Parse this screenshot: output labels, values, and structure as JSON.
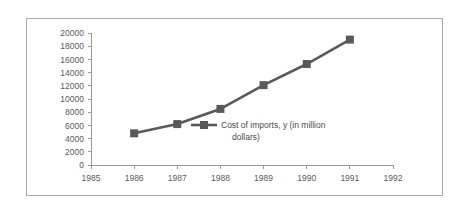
{
  "chart_data": {
    "type": "line",
    "title": "",
    "subtitle": "",
    "xlabel": "",
    "ylabel": "",
    "x": [
      1986,
      1987,
      1988,
      1989,
      1990,
      1991
    ],
    "categories": [
      "1986",
      "1987",
      "1988",
      "1989",
      "1990",
      "1991"
    ],
    "series": [
      {
        "name": "Cost of imports, y (in million dollars)",
        "values": [
          4800,
          6200,
          8500,
          12100,
          15300,
          19000
        ],
        "color": "#595959",
        "marker": "square"
      }
    ],
    "xlim": [
      1985,
      1992
    ],
    "ylim": [
      0,
      20000
    ],
    "xticks": [
      1985,
      1986,
      1987,
      1988,
      1989,
      1990,
      1991,
      1992
    ],
    "xtick_labels": [
      "1985",
      "1986",
      "1987",
      "1988",
      "1989",
      "1990",
      "1991",
      "1992"
    ],
    "yticks": [
      0,
      2000,
      4000,
      6000,
      8000,
      10000,
      12000,
      14000,
      16000,
      18000,
      20000
    ],
    "ytick_labels": [
      "0",
      "2000",
      "4000",
      "6000",
      "8000",
      "10000",
      "12000",
      "14000",
      "16000",
      "18000",
      "20000"
    ],
    "grid": false,
    "legend": {
      "position": "inside-center",
      "entries": [
        {
          "label_line1": "Cost of imports, y (in million",
          "label_line2": "dollars)",
          "label_full": "Cost of imports, y (in million dollars)",
          "color": "#595959"
        }
      ]
    },
    "colors": {
      "series": "#595959",
      "axis": "#9a9a9a",
      "tick_text": "#5a5a5a",
      "frame_border": "#a9a9a9",
      "background": "#ffffff"
    }
  }
}
